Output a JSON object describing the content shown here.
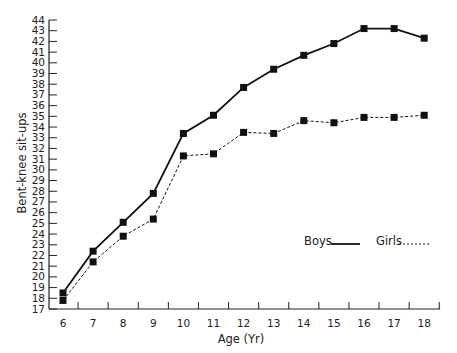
{
  "chart_data": {
    "type": "line",
    "title": "",
    "xlabel": "Age (Yr)",
    "ylabel": "Bent-knee sit-ups",
    "x": [
      6,
      7,
      8,
      9,
      10,
      11,
      12,
      13,
      14,
      15,
      16,
      17,
      18
    ],
    "ylim": [
      17,
      44
    ],
    "yticks": [
      17,
      18,
      19,
      20,
      21,
      22,
      23,
      24,
      25,
      26,
      27,
      28,
      29,
      30,
      31,
      32,
      33,
      34,
      35,
      36,
      37,
      38,
      39,
      40,
      41,
      42,
      43,
      44
    ],
    "grid": false,
    "legend_position": "lower right",
    "series": [
      {
        "name": "Boys",
        "line_style": "solid",
        "marker": "square",
        "values": [
          18.5,
          22.4,
          25.1,
          27.8,
          33.4,
          35.1,
          37.7,
          39.4,
          40.7,
          41.8,
          43.2,
          43.2,
          42.3
        ]
      },
      {
        "name": "Girls",
        "line_style": "dashed",
        "marker": "square",
        "values": [
          17.8,
          21.4,
          23.8,
          25.4,
          31.3,
          31.5,
          33.5,
          33.4,
          34.6,
          34.4,
          34.9,
          34.9,
          35.1
        ]
      }
    ]
  },
  "legend": {
    "boys_label": "Boys",
    "girls_label": "Girls"
  },
  "colors": {
    "line": "#111111",
    "text": "#222222",
    "background": "#ffffff"
  }
}
